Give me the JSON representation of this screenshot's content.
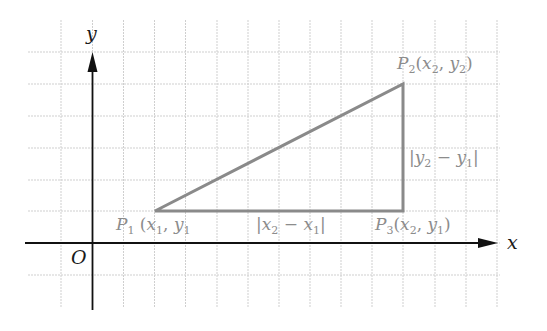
{
  "diagram": {
    "type": "coordinate-plane-distance-triangle",
    "axes": {
      "x_label": "x",
      "y_label": "y",
      "origin_label": "O"
    },
    "points": [
      {
        "id": "P1",
        "name": "P",
        "sub": "1",
        "coords_text": "(x1, y1",
        "x_var": "x",
        "x_sub": "1",
        "y_var": "y",
        "y_sub": "1"
      },
      {
        "id": "P2",
        "name": "P",
        "sub": "2",
        "coords_text": "(x2, y2)",
        "x_var": "x",
        "x_sub": "2",
        "y_var": "y",
        "y_sub": "2"
      },
      {
        "id": "P3",
        "name": "P",
        "sub": "3",
        "coords_text": "(x2, y1)",
        "x_var": "x",
        "x_sub": "2",
        "y_var": "y",
        "y_sub": "1"
      }
    ],
    "segment_labels": {
      "horizontal": "|x2 − x1|",
      "vertical": "|y2 − y1|"
    },
    "colors": {
      "grid": "#cfcfcf",
      "axis": "#111111",
      "triangle": "#8a8a8a",
      "label": "#8c8c8c"
    }
  }
}
